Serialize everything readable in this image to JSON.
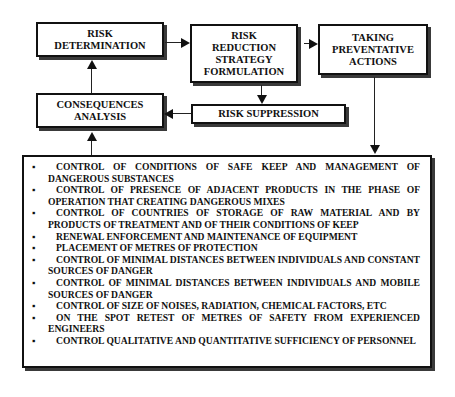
{
  "diagram": {
    "boxes": {
      "risk_determination": [
        "RISK",
        "DETERMINATION"
      ],
      "risk_reduction": [
        "RISK",
        "REDUCTION",
        "STRATEGY",
        "FORMULATION"
      ],
      "taking_actions": [
        "TAKING",
        "PREVENTATIVE",
        "ACTIONS"
      ],
      "consequences": [
        "CONSEQUENCES",
        "ANALYSIS"
      ],
      "risk_suppression": [
        "RISK SUPPRESSION"
      ]
    },
    "bullet_glyph": "▪",
    "actions_list": [
      "CONTROL OF CONDITIONS OF SAFE KEEP AND MANAGEMENT OF DANGEROUS SUBSTANCES",
      "CONTROL OF PRESENCE OF ADJACENT PRODUCTS IN THE PHASE OF OPERATION THAT CREATING DANGEROUS MIXES",
      "CONTROL OF COUNTRIES OF STORAGE OF RAW MATERIAL AND BY PRODUCTS OF TREATMENT AND OF THEIR CONDITIONS OF KEEP",
      "RENEWAL ENFORCEMENT AND MAINTENANCE OF EQUIPMENT",
      "PLACEMENT OF METRES OF PROTECTION",
      "CONTROL OF MINIMAL DISTANCES BETWEEN INDIVIDUALS AND CONSTANT SOURCES OF DANGER",
      "CONTROL OF MINIMAL DISTANCES BETWEEN INDIVIDUALS AND MOBILE SOURCES OF DANGER",
      "CONTROL OF SIZE OF NOISES, RADIATION, CHEMICAL FACTORS, ETC",
      "ON THE SPOT RETEST OF METRES OF SAFETY FROM EXPERIENCED ENGINEERS",
      "CONTROL QUALITATIVE AND QUANTITATIVE SUFFICIENCY OF PERSONNEL"
    ],
    "edges": [
      {
        "from": "risk_determination",
        "to": "risk_reduction"
      },
      {
        "from": "risk_reduction",
        "to": "taking_actions"
      },
      {
        "from": "risk_reduction",
        "to": "risk_suppression"
      },
      {
        "from": "risk_suppression",
        "to": "consequences"
      },
      {
        "from": "consequences",
        "to": "risk_determination"
      },
      {
        "from": "taking_actions",
        "to": "actions_list"
      },
      {
        "from": "actions_list",
        "to": "consequences"
      }
    ]
  }
}
